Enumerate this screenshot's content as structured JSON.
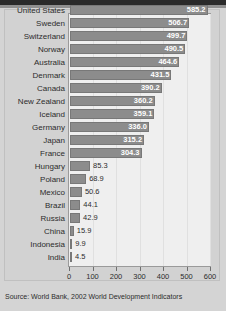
{
  "figure": {
    "source_note": "Source:  World Bank, 2002 World Development Indicators",
    "accent_bar_color": "#8c8c8c",
    "plot_background": "#efefef",
    "frame_color": "#d2d2d2"
  },
  "chart_data": {
    "type": "bar",
    "orientation": "horizontal",
    "title": "",
    "subtitle": "",
    "xlabel": "",
    "ylabel": "",
    "xlim": [
      0,
      600
    ],
    "xticks": [
      0,
      100,
      200,
      300,
      400,
      500,
      600
    ],
    "xtick_labels": [
      "0",
      "100",
      "200",
      "300",
      "400",
      "500",
      "600"
    ],
    "grid": true,
    "legend": false,
    "data_labels": true,
    "categories": [
      "United States",
      "Sweden",
      "Switzerland",
      "Norway",
      "Australia",
      "Denmark",
      "Canada",
      "New Zealand",
      "Iceland",
      "Germany",
      "Japan",
      "France",
      "Hungary",
      "Poland",
      "Mexico",
      "Brazil",
      "Russia",
      "China",
      "Indonesia",
      "India"
    ],
    "values": [
      585.2,
      506.7,
      499.7,
      490.5,
      464.6,
      431.5,
      390.2,
      360.2,
      359.1,
      336.0,
      315.2,
      304.3,
      85.3,
      68.9,
      50.6,
      44.1,
      42.9,
      15.9,
      9.9,
      4.5
    ],
    "value_labels": [
      "585.2",
      "506.7",
      "499.7",
      "490.5",
      "464.6",
      "431.5",
      "390.2",
      "360.2",
      "359.1",
      "336.0",
      "315.2",
      "304.3",
      "85.3",
      "68.9",
      "50.6",
      "44.1",
      "42.9",
      "15.9",
      "9.9",
      "4.5"
    ]
  }
}
